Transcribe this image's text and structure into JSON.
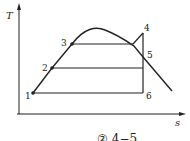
{
  "diagram": {
    "type": "T-s diagram (Rankine cycle with superheat)",
    "axes": {
      "y_label": "T",
      "x_label": "s"
    },
    "points": [
      {
        "id": "1",
        "label": "1"
      },
      {
        "id": "2",
        "label": "2"
      },
      {
        "id": "3",
        "label": "3"
      },
      {
        "id": "4",
        "label": "4"
      },
      {
        "id": "5",
        "label": "5"
      },
      {
        "id": "6",
        "label": "6"
      }
    ],
    "caption": "② 4−5"
  }
}
